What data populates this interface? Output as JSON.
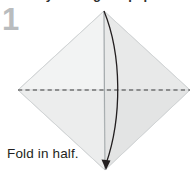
{
  "diagram": {
    "kind": "origami-instruction-step",
    "clipped_heading": "Start by folding the paper in half diagonally.",
    "step_number": "1",
    "caption": "Fold in half.",
    "colors": {
      "background": "#ffffff",
      "step_number": "#b9bcbe",
      "caption_text": "#231f20",
      "paper_left_top": "#f2f3f3",
      "paper_right_top": "#e9eaea",
      "paper_left_bottom": "#ededee",
      "paper_right_bottom": "#e4e5e5",
      "paper_edge": "#d6d8d9",
      "crease_line": "#9aa0a3",
      "fold_line": "#3a3a3a",
      "arrow": "#231f20"
    },
    "shapes": {
      "paper": {
        "name": "square-sheet-rotated-diamond",
        "top_vertex": [
          104,
          11
        ],
        "right_vertex": [
          190,
          90
        ],
        "bottom_vertex": [
          105,
          170
        ],
        "left_vertex": [
          18,
          90
        ]
      },
      "fold_line": {
        "name": "horizontal-valley-fold-dashed-line",
        "style": "dashed",
        "x_start": 18,
        "x_end": 190,
        "y": 90
      },
      "center_crease": {
        "name": "vertical-center-crease",
        "x": 104,
        "y_start": 11,
        "y_end": 170
      },
      "arrow": {
        "name": "curved-fold-direction-arrow",
        "from": [
          104,
          11
        ],
        "to": [
          105,
          170
        ],
        "bulge": "right",
        "head_at": "bottom"
      }
    }
  }
}
